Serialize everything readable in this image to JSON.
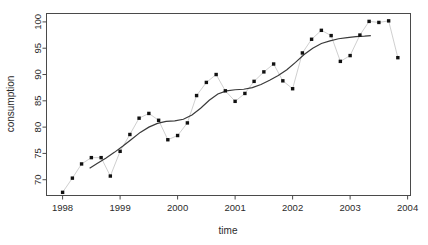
{
  "figure": {
    "background": "#ffffff",
    "frame_color": "#4a4a4a",
    "point_color": "#111111",
    "series_line_color": "#c9c9c9",
    "trend_line_color": "#3a3a3a"
  },
  "chart_data": {
    "type": "scatter",
    "title": "",
    "subtitle": "",
    "xlabel": "time",
    "ylabel": "consumption",
    "xlim": [
      1997.72,
      2004.05
    ],
    "ylim": [
      67.0,
      101.6
    ],
    "grid": false,
    "legend": null,
    "xticks": [
      1998,
      1999,
      2000,
      2001,
      2002,
      2003,
      2004
    ],
    "xticklabels": [
      "1998",
      "1999",
      "2000",
      "2001",
      "2002",
      "2003",
      "2004"
    ],
    "yticks": [
      70,
      75,
      80,
      85,
      90,
      95,
      100
    ],
    "yticklabels": [
      "70",
      "75",
      "80",
      "85",
      "90",
      "95",
      "100"
    ],
    "series": [
      {
        "name": "consumption",
        "marker": "square",
        "connected": true,
        "x": [
          1998.0,
          1998.17,
          1998.33,
          1998.5,
          1998.67,
          1998.83,
          1999.0,
          1999.17,
          1999.33,
          1999.5,
          1999.67,
          1999.83,
          2000.0,
          2000.17,
          2000.33,
          2000.5,
          2000.67,
          2000.83,
          2001.0,
          2001.17,
          2001.33,
          2001.5,
          2001.67,
          2001.83,
          2002.0,
          2002.17,
          2002.33,
          2002.5,
          2002.67,
          2002.83,
          2003.0,
          2003.17,
          2003.33,
          2003.5,
          2003.67,
          2003.83
        ],
        "y": [
          67.6,
          70.3,
          73.0,
          74.2,
          74.2,
          70.7,
          75.4,
          78.6,
          81.7,
          82.6,
          81.3,
          77.6,
          78.4,
          80.8,
          86.0,
          88.5,
          90.0,
          86.9,
          84.9,
          86.4,
          88.7,
          90.5,
          92.0,
          88.8,
          87.3,
          94.1,
          96.7,
          98.4,
          97.4,
          92.5,
          93.6,
          97.5,
          100.1,
          99.9,
          100.2,
          93.2
        ]
      }
    ],
    "trend": {
      "name": "smoothed trend",
      "x": [
        1998.47,
        1998.6,
        1998.75,
        1998.9,
        1999.05,
        1999.2,
        1999.35,
        1999.5,
        1999.65,
        1999.8,
        1999.95,
        2000.1,
        2000.25,
        2000.4,
        2000.55,
        2000.7,
        2000.85,
        2001.0,
        2001.15,
        2001.3,
        2001.45,
        2001.6,
        2001.75,
        2001.9,
        2002.05,
        2002.2,
        2002.35,
        2002.5,
        2002.65,
        2002.8,
        2002.95,
        2003.1,
        2003.25,
        2003.36
      ],
      "y": [
        72.2,
        73.1,
        74.1,
        75.2,
        76.4,
        77.7,
        79.0,
        80.0,
        80.7,
        81.1,
        81.2,
        81.5,
        82.3,
        83.6,
        85.1,
        86.3,
        86.9,
        87.1,
        87.2,
        87.5,
        88.1,
        88.9,
        89.8,
        90.9,
        92.3,
        93.8,
        95.0,
        95.9,
        96.4,
        96.8,
        97.0,
        97.2,
        97.3,
        97.4
      ]
    }
  }
}
